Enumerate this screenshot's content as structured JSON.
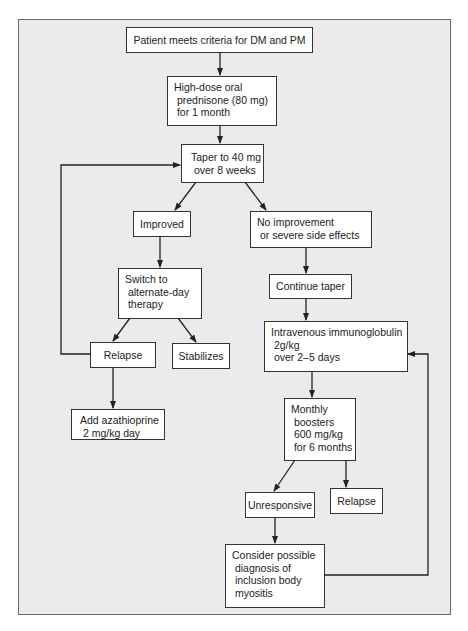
{
  "colors": {
    "frame_bg": "#ebebeb",
    "box_bg": "#ffffff",
    "line": "#222222"
  },
  "nodes": {
    "criteria": "Patient meets criteria for DM and PM",
    "prednisone": "High-dose oral\n prednisone (80 mg)\n for 1 month",
    "taper": "Taper to 40 mg\n over 8 weeks",
    "improved": "Improved",
    "no_improvement": "No improvement\n or severe side effects",
    "switch": "Switch to\n alternate-day\n therapy",
    "continue_taper": "Continue taper",
    "relapse_left": "Relapse",
    "stabilizes": "Stabilizes",
    "ivig": "Intravenous immunoglobulin\n 2g/kg\n over 2–5 days",
    "azathioprine": "Add azathioprine\n 2 mg/kg day",
    "boosters": "Monthly\n boosters\n 600 mg/kg\n for 6 months",
    "unresponsive": "Unresponsive",
    "relapse_right": "Relapse",
    "consider": "Consider possible\n diagnosis of\n inclusion body\n myositis"
  },
  "edges": [
    [
      "criteria",
      "prednisone"
    ],
    [
      "prednisone",
      "taper"
    ],
    [
      "taper",
      "improved"
    ],
    [
      "taper",
      "no_improvement"
    ],
    [
      "improved",
      "switch"
    ],
    [
      "no_improvement",
      "continue_taper"
    ],
    [
      "switch",
      "relapse_left"
    ],
    [
      "switch",
      "stabilizes"
    ],
    [
      "continue_taper",
      "ivig"
    ],
    [
      "relapse_left",
      "azathioprine"
    ],
    [
      "relapse_left",
      "taper"
    ],
    [
      "ivig",
      "boosters"
    ],
    [
      "boosters",
      "unresponsive"
    ],
    [
      "boosters",
      "relapse_right"
    ],
    [
      "unresponsive",
      "consider"
    ],
    [
      "consider",
      "ivig"
    ]
  ]
}
